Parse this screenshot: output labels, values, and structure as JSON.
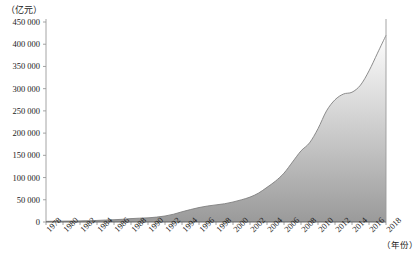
{
  "chart_data": {
    "type": "area",
    "title": "",
    "subtitle": "",
    "xlabel": "（年份）",
    "ylabel": "（亿元）",
    "unit_note_y": "（亿元）",
    "unit_note_x": "（年份）",
    "grid": false,
    "legend_position": "none",
    "ylim": [
      0,
      450000
    ],
    "ytick_step": 50000,
    "ytick_labels": [
      "0",
      "50 000",
      "100 000",
      "150 000",
      "200 000",
      "250 000",
      "300 000",
      "350 000",
      "400 000",
      "450 000"
    ],
    "ytick_values": [
      0,
      50000,
      100000,
      150000,
      200000,
      250000,
      300000,
      350000,
      400000,
      450000
    ],
    "xlim": [
      1978,
      2018
    ],
    "xtick_labels": [
      "1978",
      "1980",
      "1982",
      "1984",
      "1986",
      "1988",
      "1990",
      "1992",
      "1994",
      "1996",
      "1998",
      "2000",
      "2002",
      "2004",
      "2006",
      "2008",
      "2010",
      "2012",
      "2014",
      "2016",
      "2018"
    ],
    "xtick_values": [
      1978,
      1980,
      1982,
      1984,
      1986,
      1988,
      1990,
      1992,
      1994,
      1996,
      1998,
      2000,
      2002,
      2004,
      2006,
      2008,
      2010,
      2012,
      2014,
      2016,
      2018
    ],
    "x": [
      1978,
      1979,
      1980,
      1981,
      1982,
      1983,
      1984,
      1985,
      1986,
      1987,
      1988,
      1989,
      1990,
      1991,
      1992,
      1993,
      1994,
      1995,
      1996,
      1997,
      1998,
      1999,
      2000,
      2001,
      2002,
      2003,
      2004,
      2005,
      2006,
      2007,
      2008,
      2009,
      2010,
      2011,
      2012,
      2013,
      2014,
      2015,
      2016,
      2017,
      2018
    ],
    "values": [
      1500,
      1700,
      1950,
      2200,
      2500,
      2900,
      3500,
      4400,
      5100,
      6100,
      7600,
      8600,
      9300,
      11000,
      13500,
      17500,
      23000,
      28000,
      32500,
      36000,
      38500,
      41000,
      45000,
      50000,
      56000,
      65000,
      78000,
      92000,
      110000,
      135000,
      160000,
      178000,
      210000,
      250000,
      275000,
      288000,
      292000,
      308000,
      340000,
      380000,
      420000
    ],
    "series_name": "",
    "annotations": [],
    "style": {
      "line_color": "#808080",
      "fill_gradient_top": "#fdfdfd",
      "fill_gradient_bottom": "#9a9a9a",
      "axis_color": "#9a9a9a",
      "text_color": "#1a1a1a",
      "background": "#ffffff"
    }
  }
}
